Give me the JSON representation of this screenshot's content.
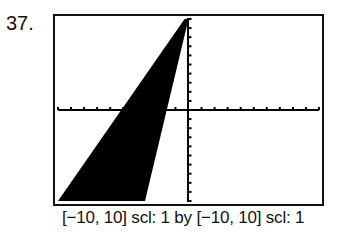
{
  "problem_number": "37.",
  "caption": "[−10, 10] scl: 1 by [−10, 10] scl: 1",
  "chart_data": {
    "type": "area",
    "title": "",
    "window": {
      "xmin": -10,
      "xmax": 10,
      "xscl": 1,
      "ymin": -10,
      "ymax": 10,
      "yscl": 1
    },
    "series": [
      {
        "name": "boundary line 1",
        "equation": "y = 2x + 10",
        "x": [
          -10,
          0
        ],
        "y": [
          -10,
          10
        ]
      },
      {
        "name": "boundary line 2",
        "equation": "y = 6x + 10",
        "x": [
          -3.33,
          0
        ],
        "y": [
          -10,
          10
        ]
      }
    ],
    "shaded_region": "between y = 6x + 10 and y = 2x + 10 for x ≤ 0",
    "fill_color": "#000000",
    "xlabel": "",
    "ylabel": "",
    "grid": false,
    "ticks": {
      "x_step": 1,
      "y_step": 1
    }
  }
}
